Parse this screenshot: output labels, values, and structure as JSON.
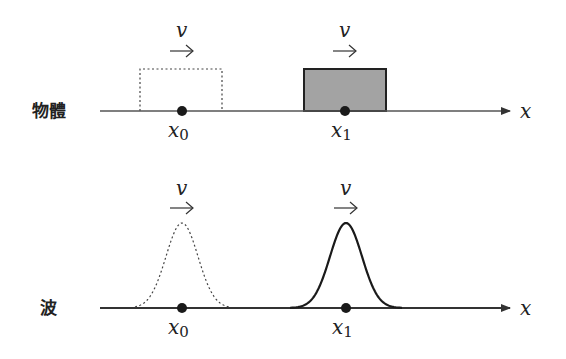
{
  "panels": [
    {
      "label": "物體",
      "kind": "object",
      "axis_label": "x",
      "velocity_label": "v",
      "positions": [
        {
          "symbol": "x",
          "subscript": "0",
          "state": "initial",
          "style": "dashed"
        },
        {
          "symbol": "x",
          "subscript": "1",
          "state": "later",
          "style": "solid-filled"
        }
      ]
    },
    {
      "label": "波",
      "kind": "wave",
      "axis_label": "x",
      "velocity_label": "v",
      "positions": [
        {
          "symbol": "x",
          "subscript": "0",
          "state": "initial",
          "style": "dashed"
        },
        {
          "symbol": "x",
          "subscript": "1",
          "state": "later",
          "style": "solid"
        }
      ]
    }
  ],
  "colors": {
    "line": "#333333",
    "box_fill": "#a3a3a3",
    "dot": "#1a1a1a"
  }
}
